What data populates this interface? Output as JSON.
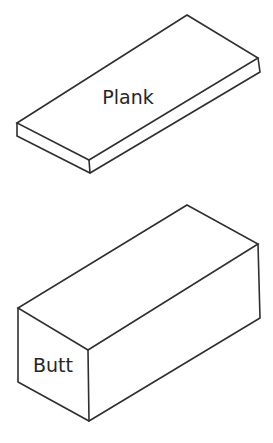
{
  "figure": {
    "background": "#ffffff",
    "line_color": "#2f2f2f",
    "text_color": "#262626"
  },
  "shapes": {
    "plank": {
      "label": "Plank",
      "form": "thin-rectangular-box-wireframe"
    },
    "butt": {
      "label": "Butt",
      "form": "thick-rectangular-box-wireframe"
    }
  }
}
